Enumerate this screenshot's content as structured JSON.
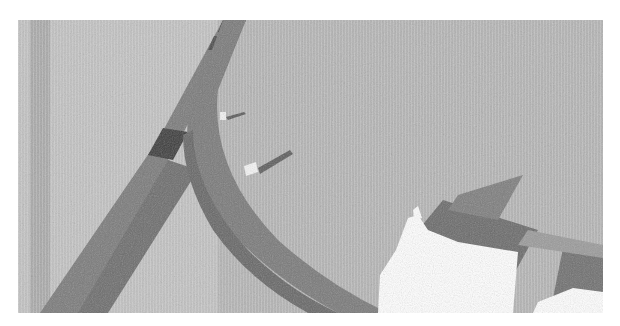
{
  "image": {
    "description": "Grayscale top-down render of two dark road strips crossing textured ground, with white blocky objects at lower right",
    "colors": {
      "page_background": "#ffffff",
      "ground_light": "#c4c4c4",
      "ground_mid": "#a9a9a9",
      "ground_dark": "#8e8e8e",
      "road": "#7d7d7d",
      "road_dark": "#5e5e5e",
      "road_darkest": "#2e2e2e",
      "platform": "#6a6a6a",
      "object_white": "#ffffff"
    }
  }
}
